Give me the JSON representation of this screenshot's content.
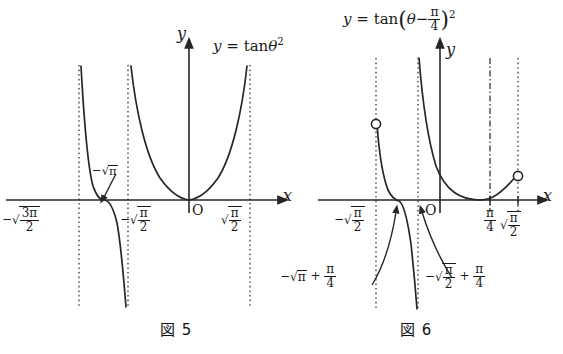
{
  "page": {
    "background": "#ffffff",
    "ink": "#1a1a1a",
    "width": 563,
    "height": 354
  },
  "figures": [
    {
      "id": "figure-5",
      "caption": "図 5",
      "equation": {
        "lhs": "y",
        "eq": "=",
        "fn": "tan",
        "arg": "θ",
        "exponent": "2",
        "plain": "y = tan θ²"
      },
      "axes": {
        "x_label": "x",
        "y_label": "y",
        "origin_label": "O"
      },
      "x_tick_labels": [
        {
          "name": "neg-sqrt-3pi-over-2",
          "minus": "−",
          "root_num": "3π",
          "root_den": "2"
        },
        {
          "name": "neg-sqrt-pi-over-2",
          "minus": "−",
          "root_num": "π",
          "root_den": "2"
        },
        {
          "name": "pos-sqrt-pi-over-2",
          "minus": "",
          "root_num": "π",
          "root_den": "2"
        }
      ],
      "annotations": [
        {
          "name": "neg-sqrt-pi-callout",
          "minus": "−",
          "root": "π",
          "plain": "−√π"
        }
      ],
      "asymptotes": [
        {
          "name": "asymptote-neg-sqrt-3pi-over-2",
          "style": "dotted"
        },
        {
          "name": "asymptote-neg-sqrt-pi-over-2",
          "style": "dotted"
        },
        {
          "name": "asymptote-pos-sqrt-pi-over-2",
          "style": "dotted"
        }
      ]
    },
    {
      "id": "figure-6",
      "caption": "図 6",
      "equation": {
        "lhs": "y",
        "eq": "=",
        "fn": "tan",
        "open": "(",
        "arg": "θ",
        "op": "−",
        "frac_num": "π",
        "frac_den": "4",
        "close": ")",
        "exponent": "2",
        "plain": "y = tan(θ − π/4)²"
      },
      "axes": {
        "x_label": "x",
        "y_label": "y",
        "origin_label": "O"
      },
      "x_tick_labels": [
        {
          "name": "neg-sqrt-pi-over-2",
          "minus": "−",
          "root_num": "π",
          "root_den": "2"
        },
        {
          "name": "pi-over-4",
          "num": "π",
          "den": "4"
        },
        {
          "name": "sqrt-pi-over-2",
          "minus": "",
          "root_num": "π",
          "root_den": "2"
        }
      ],
      "annotations": [
        {
          "name": "neg-sqrt-pi-plus-pi-over-4-callout",
          "minus": "−",
          "root": "π",
          "plus": "+",
          "frac_num": "π",
          "frac_den": "4",
          "plain": "−√π + π/4"
        },
        {
          "name": "neg-sqrt-pi-over-2-plus-pi-over-4-callout",
          "minus": "−",
          "root_num": "π",
          "root_den": "2",
          "plus": "+",
          "frac_num": "π",
          "frac_den": "4",
          "plain": "−√(π/2) + π/4"
        }
      ],
      "asymptotes": [
        {
          "name": "asymptote-left-dotted",
          "style": "dotted"
        },
        {
          "name": "asymptote-mid-dotted",
          "style": "dotted"
        },
        {
          "name": "minimum-line-pi-over-4",
          "style": "dash-dot"
        },
        {
          "name": "asymptote-right-dotted",
          "style": "dotted"
        }
      ],
      "open_points": [
        {
          "name": "open-point-upper-left"
        },
        {
          "name": "open-point-lower-right"
        }
      ]
    }
  ]
}
